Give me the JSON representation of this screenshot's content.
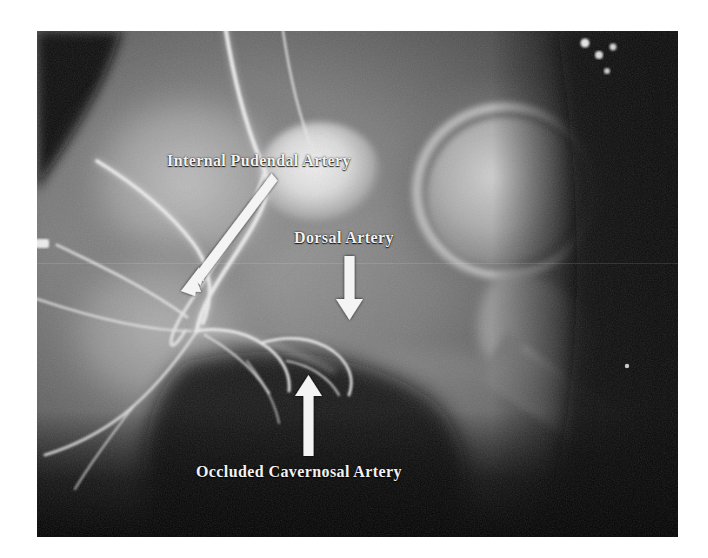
{
  "image": {
    "type": "medical-radiograph",
    "modality": "angiogram",
    "region": "pelvis-and-hip",
    "background_color": "#ffffff",
    "plate_color": "#0a0a0a",
    "annotation_color": "#f2f2f2"
  },
  "annotations": [
    {
      "id": "internal-pudendal-artery",
      "label": "Internal Pudendal Artery",
      "arrow": "diagonal-down-left",
      "arrow_from": [
        272,
        178
      ],
      "arrow_to": [
        184,
        288
      ]
    },
    {
      "id": "dorsal-artery",
      "label": "Dorsal Artery",
      "arrow": "down",
      "arrow_from": [
        350,
        257
      ],
      "arrow_to": [
        350,
        318
      ]
    },
    {
      "id": "occluded-cavernosal-artery",
      "label": "Occluded Cavernosal Artery",
      "arrow": "up",
      "arrow_from": [
        309,
        456
      ],
      "arrow_to": [
        309,
        377
      ]
    }
  ]
}
